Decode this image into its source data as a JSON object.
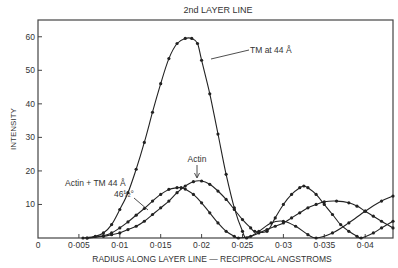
{
  "chart_data": {
    "type": "line",
    "title": "2nd LAYER LINE",
    "xlabel": "RADIUS ALONG LAYER LINE — RECIPROCAL ANGSTROMS",
    "ylabel": "INTENSITY",
    "xlim": [
      0,
      0.0434
    ],
    "ylim": [
      0,
      65
    ],
    "grid": false,
    "x_ticks": [
      0,
      0.005,
      0.01,
      0.015,
      0.02,
      0.025,
      0.03,
      0.035,
      0.04
    ],
    "x_tick_labels": [
      "0",
      "0·005",
      "0·01",
      "0·015",
      "0·02",
      "0·025",
      "0·03",
      "0·035",
      "0·04"
    ],
    "y_ticks": [
      10,
      20,
      30,
      40,
      50,
      60
    ],
    "y_tick_labels": [
      "10",
      "20",
      "30",
      "40",
      "50",
      "60"
    ],
    "series": [
      {
        "name": "TM at 44 Å",
        "x": [
          0.0055,
          0.007,
          0.008,
          0.009,
          0.01,
          0.011,
          0.012,
          0.013,
          0.014,
          0.015,
          0.016,
          0.017,
          0.018,
          0.0188,
          0.0195,
          0.02,
          0.021,
          0.022,
          0.023,
          0.024,
          0.025,
          0.0255,
          0.027,
          0.0285,
          0.03,
          0.0315,
          0.033,
          0.034,
          0.036,
          0.038,
          0.04,
          0.042,
          0.0434
        ],
        "y": [
          0,
          0.5,
          1.5,
          4,
          8.5,
          13.5,
          20.5,
          28.5,
          37.5,
          46,
          53.5,
          58,
          59.5,
          59.5,
          58,
          53,
          43,
          31,
          19,
          9,
          2,
          0,
          2,
          4.5,
          5,
          3.5,
          1,
          0,
          1.5,
          4.5,
          8,
          11,
          12.5
        ]
      },
      {
        "name": "Actin",
        "x": [
          0.006,
          0.008,
          0.009,
          0.01,
          0.011,
          0.012,
          0.013,
          0.014,
          0.015,
          0.016,
          0.017,
          0.018,
          0.019,
          0.02,
          0.021,
          0.022,
          0.023,
          0.024,
          0.025,
          0.026,
          0.0265,
          0.028,
          0.029,
          0.03,
          0.031,
          0.032,
          0.0325,
          0.033,
          0.034,
          0.035,
          0.036,
          0.037,
          0.038,
          0.039,
          0.0395,
          0.041,
          0.042,
          0.0434
        ],
        "y": [
          0,
          0.5,
          1,
          1.5,
          2.5,
          3.5,
          5,
          7,
          9,
          11,
          13.5,
          15.5,
          16.8,
          17,
          16,
          14,
          11.5,
          8.5,
          5.5,
          3,
          2,
          2,
          6,
          10,
          13,
          15,
          15.5,
          15,
          13,
          10,
          7,
          4,
          2,
          0.5,
          0,
          1.5,
          3,
          5
        ]
      },
      {
        "name": "Actin + TM 44 Å 46½°",
        "x": [
          0.006,
          0.008,
          0.009,
          0.01,
          0.011,
          0.012,
          0.013,
          0.014,
          0.015,
          0.016,
          0.017,
          0.0175,
          0.018,
          0.019,
          0.02,
          0.021,
          0.022,
          0.023,
          0.024,
          0.0245,
          0.026,
          0.027,
          0.028,
          0.029,
          0.03,
          0.031,
          0.032,
          0.033,
          0.034,
          0.035,
          0.0365,
          0.038,
          0.039,
          0.04,
          0.041,
          0.042,
          0.0434
        ],
        "y": [
          0,
          0.7,
          1.5,
          3,
          4.8,
          6.8,
          8.8,
          11,
          13,
          14.5,
          15,
          15,
          14.6,
          13,
          10.5,
          7.5,
          4.5,
          2,
          0.5,
          0,
          0.5,
          1.5,
          2.5,
          3.5,
          4.5,
          6,
          7.5,
          9,
          10,
          10.8,
          11,
          10.5,
          9.5,
          8,
          6.5,
          5,
          3
        ]
      }
    ],
    "annotations": [
      {
        "text": "TM at 44 Å",
        "points_to_series": "TM at 44 Å"
      },
      {
        "text": "Actin",
        "points_to_series": "Actin"
      },
      {
        "text": "Actin + TM 44 Å",
        "points_to_series": "Actin + TM 44 Å 46½°"
      },
      {
        "text": "46½°",
        "points_to_series": "Actin + TM 44 Å 46½°"
      }
    ],
    "legend": "none (inline annotations)"
  },
  "labels": {
    "title": "2nd LAYER LINE",
    "xlabel": "RADIUS ALONG LAYER LINE — RECIPROCAL ANGSTROMS",
    "ylabel": "INTENSITY",
    "ann_tm": "TM at 44 Å",
    "ann_actin": "Actin",
    "ann_combo_1": "Actin + TM 44 Å",
    "ann_combo_2": "46½°"
  },
  "style": {
    "line_color": "#222222",
    "frame_color": "#444444",
    "text_color": "#333333"
  }
}
